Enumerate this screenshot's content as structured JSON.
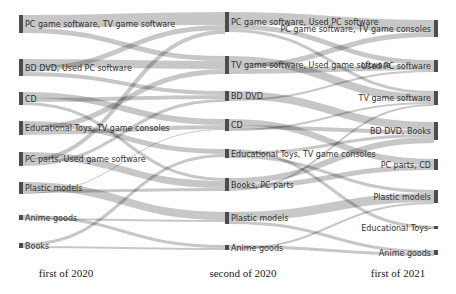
{
  "figure": {
    "type": "sankey",
    "title": "",
    "width": 456,
    "height": 294,
    "background": "#ffffff",
    "node_color": "#4d4d4d",
    "link_color": "#999999"
  },
  "axis": {
    "labels": [
      {
        "id": "stage1",
        "text": "first of 2020",
        "x": 66,
        "y": 277
      },
      {
        "id": "stage2",
        "text": "second of 2020",
        "x": 243,
        "y": 277
      },
      {
        "id": "stage3",
        "text": "first of 2021",
        "x": 398,
        "y": 277
      }
    ]
  },
  "chart_data": {
    "type": "sankey",
    "title": "",
    "stages": [
      "first of 2020",
      "second of 2020",
      "first of 2021"
    ],
    "columns": [
      {
        "stage": "first of 2020",
        "x": 19,
        "align": "left",
        "nodes": [
          {
            "id": "L1",
            "label": "PC game software, TV game software",
            "y": 15,
            "height": 18,
            "value": 18
          },
          {
            "id": "L2",
            "label": "BD DVD, Used PC software",
            "y": 59,
            "height": 17,
            "value": 17
          },
          {
            "id": "L3",
            "label": "CD",
            "y": 92,
            "height": 13,
            "value": 13
          },
          {
            "id": "L4",
            "label": "Educational Toys, TV game consoles",
            "y": 121,
            "height": 14,
            "value": 14
          },
          {
            "id": "L5",
            "label": "PC parts, Used game software",
            "y": 152,
            "height": 14,
            "value": 14
          },
          {
            "id": "L6",
            "label": "Plastic models",
            "y": 182,
            "height": 12,
            "value": 12
          },
          {
            "id": "L7",
            "label": "Anime goods",
            "y": 215,
            "height": 5,
            "value": 5
          },
          {
            "id": "L8",
            "label": "Books",
            "y": 243,
            "height": 5,
            "value": 5
          }
        ]
      },
      {
        "stage": "second of 2020",
        "x": 225,
        "align": "left",
        "nodes": [
          {
            "id": "M1",
            "label": "PC game software, Used PC software",
            "y": 12,
            "height": 20,
            "value": 20
          },
          {
            "id": "M2",
            "label": "TV game software, Used game software",
            "y": 56,
            "height": 18,
            "value": 18
          },
          {
            "id": "M3",
            "label": "BD DVD",
            "y": 91,
            "height": 10,
            "value": 10
          },
          {
            "id": "M4",
            "label": "CD",
            "y": 119,
            "height": 12,
            "value": 12
          },
          {
            "id": "M5",
            "label": "Educational Toys, TV game consoles",
            "y": 149,
            "height": 9,
            "value": 9
          },
          {
            "id": "M6",
            "label": "Books, PC parts",
            "y": 178,
            "height": 13,
            "value": 13
          },
          {
            "id": "M7",
            "label": "Plastic models",
            "y": 212,
            "height": 12,
            "value": 12
          },
          {
            "id": "M8",
            "label": "Anime goods",
            "y": 245,
            "height": 5,
            "value": 5
          }
        ]
      },
      {
        "stage": "first of 2021",
        "x": 434,
        "align": "right",
        "nodes": [
          {
            "id": "R1",
            "label": "PC game software, TV game consoles",
            "y": 20,
            "height": 17,
            "value": 17
          },
          {
            "id": "R2",
            "label": "Used PC software",
            "y": 60,
            "height": 12,
            "value": 12
          },
          {
            "id": "R3",
            "label": "TV game software",
            "y": 91,
            "height": 14,
            "value": 14
          },
          {
            "id": "R4",
            "label": "BD DVD, Books",
            "y": 122,
            "height": 18,
            "value": 18
          },
          {
            "id": "R5",
            "label": "PC parts, CD",
            "y": 159,
            "height": 11,
            "value": 11
          },
          {
            "id": "R6",
            "label": "Plastic models",
            "y": 190,
            "height": 13,
            "value": 13
          },
          {
            "id": "R7",
            "label": "Educational Toys-",
            "y": 226,
            "height": 3,
            "value": 3
          },
          {
            "id": "R8",
            "label": "Anime goods",
            "y": 250,
            "height": 5,
            "value": 5
          }
        ]
      }
    ],
    "links": [
      {
        "source": "L1",
        "target": "M1",
        "value": 13,
        "sy": 0,
        "ty": 0
      },
      {
        "source": "L1",
        "target": "M2",
        "value": 5,
        "sy": 13,
        "ty": 0
      },
      {
        "source": "L2",
        "target": "M2",
        "value": 8,
        "sy": 0,
        "ty": 5
      },
      {
        "source": "L2",
        "target": "M1",
        "value": 5,
        "sy": 8,
        "ty": 13
      },
      {
        "source": "L2",
        "target": "M3",
        "value": 4,
        "sy": 13,
        "ty": 0
      },
      {
        "source": "L3",
        "target": "M4",
        "value": 6,
        "sy": 0,
        "ty": 0
      },
      {
        "source": "L3",
        "target": "M3",
        "value": 4,
        "sy": 6,
        "ty": 4
      },
      {
        "source": "L3",
        "target": "M6",
        "value": 3,
        "sy": 10,
        "ty": 0
      },
      {
        "source": "L4",
        "target": "M5",
        "value": 5,
        "sy": 0,
        "ty": 0
      },
      {
        "source": "L4",
        "target": "M2",
        "value": 5,
        "sy": 5,
        "ty": 13
      },
      {
        "source": "L4",
        "target": "M4",
        "value": 4,
        "sy": 10,
        "ty": 6
      },
      {
        "source": "L5",
        "target": "M6",
        "value": 7,
        "sy": 0,
        "ty": 3
      },
      {
        "source": "L5",
        "target": "M1",
        "value": 4,
        "sy": 7,
        "ty": 18
      },
      {
        "source": "L5",
        "target": "M3",
        "value": 3,
        "sy": 11,
        "ty": 8
      },
      {
        "source": "L6",
        "target": "M7",
        "value": 8,
        "sy": 0,
        "ty": 0
      },
      {
        "source": "L6",
        "target": "M6",
        "value": 3,
        "sy": 8,
        "ty": 10
      },
      {
        "source": "L6",
        "target": "M4",
        "value": 1,
        "sy": 11,
        "ty": 10
      },
      {
        "source": "L7",
        "target": "M8",
        "value": 3,
        "sy": 0,
        "ty": 0
      },
      {
        "source": "L7",
        "target": "M7",
        "value": 2,
        "sy": 3,
        "ty": 8
      },
      {
        "source": "L8",
        "target": "M5",
        "value": 3,
        "sy": 0,
        "ty": 5
      },
      {
        "source": "L8",
        "target": "M8",
        "value": 2,
        "sy": 3,
        "ty": 3
      },
      {
        "source": "M1",
        "target": "R1",
        "value": 12,
        "sy": 0,
        "ty": 0
      },
      {
        "source": "M1",
        "target": "R2",
        "value": 5,
        "sy": 12,
        "ty": 0
      },
      {
        "source": "M1",
        "target": "R3",
        "value": 3,
        "sy": 17,
        "ty": 0
      },
      {
        "source": "M2",
        "target": "R3",
        "value": 8,
        "sy": 0,
        "ty": 3
      },
      {
        "source": "M2",
        "target": "R1",
        "value": 5,
        "sy": 8,
        "ty": 12
      },
      {
        "source": "M2",
        "target": "R2",
        "value": 5,
        "sy": 13,
        "ty": 5
      },
      {
        "source": "M3",
        "target": "R4",
        "value": 8,
        "sy": 0,
        "ty": 0
      },
      {
        "source": "M3",
        "target": "R2",
        "value": 2,
        "sy": 8,
        "ty": 10
      },
      {
        "source": "M4",
        "target": "R5",
        "value": 6,
        "sy": 0,
        "ty": 0
      },
      {
        "source": "M4",
        "target": "R4",
        "value": 4,
        "sy": 6,
        "ty": 8
      },
      {
        "source": "M4",
        "target": "R3",
        "value": 2,
        "sy": 10,
        "ty": 11
      },
      {
        "source": "M5",
        "target": "R7",
        "value": 3,
        "sy": 0,
        "ty": 0
      },
      {
        "source": "M5",
        "target": "R4",
        "value": 3,
        "sy": 3,
        "ty": 12
      },
      {
        "source": "M5",
        "target": "R6",
        "value": 3,
        "sy": 6,
        "ty": 0
      },
      {
        "source": "M6",
        "target": "R4",
        "value": 6,
        "sy": 0,
        "ty": 15
      },
      {
        "source": "M6",
        "target": "R5",
        "value": 5,
        "sy": 6,
        "ty": 6
      },
      {
        "source": "M6",
        "target": "R3",
        "value": 2,
        "sy": 11,
        "ty": 13
      },
      {
        "source": "M7",
        "target": "R6",
        "value": 9,
        "sy": 0,
        "ty": 3
      },
      {
        "source": "M7",
        "target": "R8",
        "value": 3,
        "sy": 9,
        "ty": 0
      },
      {
        "source": "M8",
        "target": "R8",
        "value": 3,
        "sy": 0,
        "ty": 3
      },
      {
        "source": "M8",
        "target": "R6",
        "value": 2,
        "sy": 3,
        "ty": 12
      }
    ]
  }
}
